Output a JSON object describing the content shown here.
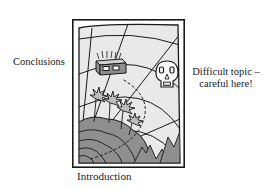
{
  "figure": {
    "type": "treasure-map-metaphor",
    "labels": {
      "conclusions": "Conclusions",
      "difficult_line1": "Difficult topic –",
      "difficult_line2": "careful here!",
      "introduction": "Introduction"
    },
    "icons": {
      "chest": "treasure-chest-icon",
      "skull": "skull-icon",
      "palms": "palm-tree-icon",
      "mountains": "mountain-icon"
    },
    "colors": {
      "ink": "#1a1a1a",
      "paper": "#e9e9e9",
      "land": "#8f8f8f",
      "frame": "#ffffff"
    }
  }
}
